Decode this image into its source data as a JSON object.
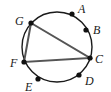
{
  "diagram": {
    "type": "circle-with-inscribed-triangle",
    "circle": {
      "cx": 57,
      "cy": 47,
      "r": 35,
      "stroke": "#1a1a1a"
    },
    "points": [
      {
        "label": "A",
        "x": 72,
        "y": 14,
        "lx": 78,
        "ly": 13
      },
      {
        "label": "B",
        "x": 86,
        "y": 30,
        "lx": 93,
        "ly": 34
      },
      {
        "label": "C",
        "x": 90,
        "y": 58,
        "lx": 95,
        "ly": 63
      },
      {
        "label": "D",
        "x": 79,
        "y": 75,
        "lx": 85,
        "ly": 85
      },
      {
        "label": "E",
        "x": 38,
        "y": 79,
        "lx": 25,
        "ly": 91
      },
      {
        "label": "F",
        "x": 24,
        "y": 62,
        "lx": 10,
        "ly": 67
      },
      {
        "label": "G",
        "x": 31,
        "y": 23,
        "lx": 15,
        "ly": 25
      }
    ],
    "triangle": {
      "vertices": [
        "G",
        "C",
        "F"
      ],
      "stroke": "#555555"
    }
  }
}
